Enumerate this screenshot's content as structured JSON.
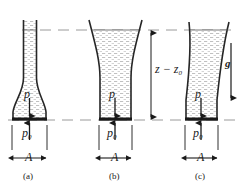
{
  "figure": {
    "type": "physics-diagram",
    "reference_lines": {
      "free_surface_label": "free surface level",
      "base_level_label": "base level"
    },
    "height_label": "z − z",
    "height_label_sub": "0",
    "gravity_label": "g",
    "pressure_label": "p",
    "base_pressure_label": "p",
    "base_pressure_sub": "0",
    "area_label": "A",
    "panels": [
      {
        "caption": "(a)",
        "shape": "narrow-neck-flask"
      },
      {
        "caption": "(b)",
        "shape": "flared-funnel"
      },
      {
        "caption": "(c)",
        "shape": "curved-tube"
      }
    ],
    "colors": {
      "ink": "#1a1a1a",
      "fluid_fill": "#e9e9e9",
      "outline": "#262626",
      "dashed_guide": "#9a9a9a"
    }
  }
}
